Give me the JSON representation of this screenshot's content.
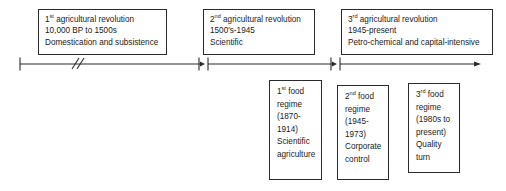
{
  "diagram": {
    "line_color": "#2b2b2b",
    "text_color": "#1a1a1a",
    "background": "#ffffff"
  },
  "revolutions": [
    {
      "ordinal": "1",
      "ordinal_suffix": "st",
      "heading_rest": " agricultural revolution",
      "period": "10,000 BP to 1500s",
      "descriptor": "Domestication and subsistence"
    },
    {
      "ordinal": "2",
      "ordinal_suffix": "nd",
      "heading_rest": " agricultural revolution",
      "period": "1500's-1945",
      "descriptor": "Scientific"
    },
    {
      "ordinal": "3",
      "ordinal_suffix": "rd",
      "heading_rest": " agricultural revolution",
      "period": "1945-present",
      "descriptor": "Petro-chemical and capital-intensive"
    }
  ],
  "food_regimes": [
    {
      "ordinal": "1",
      "ordinal_suffix": "st",
      "heading_rest": " food",
      "line2": "regime",
      "line3": "(1870-",
      "line4": "1914)",
      "line5": "Scientific",
      "line6": "agriculture"
    },
    {
      "ordinal": "2",
      "ordinal_suffix": "nd",
      "heading_rest": " food",
      "line2": "regime",
      "line3": "(1945-",
      "line4": "1973)",
      "line5": "Corporate",
      "line6": "control"
    },
    {
      "ordinal": "3",
      "ordinal_suffix": "rd",
      "heading_rest": " food",
      "line2": "regime",
      "line3": "(1980s to",
      "line4": "present)",
      "line5": "Quality",
      "line6": "turn"
    }
  ],
  "axis": {
    "break_symbol": "//",
    "segments": [
      {
        "name": "segment-1",
        "x1": 20,
        "x2": 199
      },
      {
        "name": "segment-2",
        "x1": 208,
        "x2": 331
      },
      {
        "name": "segment-3",
        "x1": 340,
        "x2": 480
      }
    ],
    "ticks": [
      20,
      199,
      208,
      331,
      340
    ],
    "arrow_end_x": 480
  }
}
